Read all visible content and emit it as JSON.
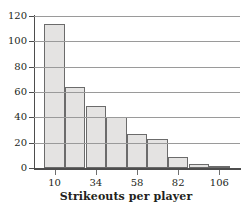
{
  "chart_data": {
    "type": "bar",
    "title": "",
    "xlabel": "Strikeouts per player",
    "ylabel": "",
    "grid": true,
    "legend": false,
    "bin_width": 12,
    "bin_starts": [
      4,
      16,
      28,
      40,
      52,
      64,
      76,
      88,
      100
    ],
    "categories": [
      "4-16",
      "16-28",
      "28-40",
      "40-52",
      "52-64",
      "64-76",
      "76-88",
      "88-100",
      "100-112"
    ],
    "values": [
      114,
      64,
      49,
      40,
      27,
      23,
      9,
      3,
      1
    ],
    "xlim": [
      -2,
      118
    ],
    "ylim": [
      0,
      120
    ],
    "xticks": [
      10,
      34,
      58,
      82,
      106
    ],
    "xtick_labels": [
      "10",
      "34",
      "58",
      "82",
      "106"
    ],
    "yticks": [
      0,
      20,
      40,
      60,
      80,
      100,
      120
    ],
    "ytick_labels": [
      "0",
      "20",
      "40",
      "60",
      "80",
      "100",
      "120"
    ],
    "bar_fill_color": "#e4e3e2",
    "bar_edge_color": "#6b6b6b",
    "gridline_color": "#9a9a9a",
    "axis_color": "#4d4d4d",
    "text_color": "#231f20"
  }
}
